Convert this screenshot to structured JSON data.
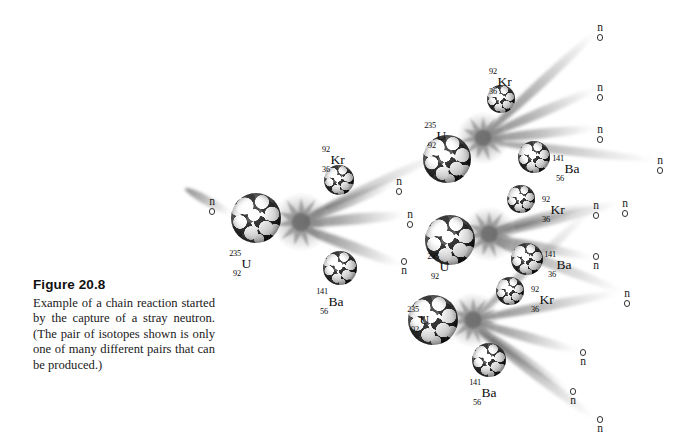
{
  "figure": {
    "number": "Figure 20.8",
    "caption": "Example of a chain reaction started by the capture of a stray neutron. (The pair of isotopes shown is only one of many different pairs that can be produced.)"
  },
  "chart_data": {
    "type": "diagram",
    "title": "Figure 20.8",
    "subtitle": "Nuclear fission chain reaction of uranium-235",
    "generations": 3,
    "neutrons_per_fission": 3,
    "target_nuclide": "235-92 U",
    "fission_products": [
      "92-36 Kr",
      "141-56 Ba"
    ],
    "nuclides": [
      {
        "id": "u-1",
        "symbol": "U",
        "mass": "235",
        "atomic": "92",
        "x": 256,
        "y": 218,
        "r": 25,
        "label_x": 226,
        "label_y": 250
      },
      {
        "id": "kr-1",
        "symbol": "Kr",
        "mass": "92",
        "atomic": "36",
        "x": 339,
        "y": 180,
        "r": 15,
        "label_x": 315,
        "label_y": 146
      },
      {
        "id": "ba-1",
        "symbol": "Ba",
        "mass": "141",
        "atomic": "56",
        "x": 340,
        "y": 268,
        "r": 17,
        "label_x": 313,
        "label_y": 288
      },
      {
        "id": "u-2",
        "symbol": "U",
        "mass": "235",
        "atomic": "92",
        "x": 447,
        "y": 159,
        "r": 24,
        "label_x": 421,
        "label_y": 122
      },
      {
        "id": "kr-2",
        "symbol": "Kr",
        "mass": "92",
        "atomic": "36",
        "x": 501,
        "y": 99,
        "r": 14,
        "label_x": 482,
        "label_y": 68
      },
      {
        "id": "ba-2",
        "symbol": "Ba",
        "mass": "141",
        "atomic": "56",
        "x": 534,
        "y": 157,
        "r": 16,
        "label_x": 549,
        "label_y": 155
      },
      {
        "id": "u-3",
        "symbol": "U",
        "mass": "235",
        "atomic": "92",
        "x": 450,
        "y": 240,
        "r": 25,
        "label_x": 424,
        "label_y": 253
      },
      {
        "id": "kr-3",
        "symbol": "Kr",
        "mass": "92",
        "atomic": "36",
        "x": 521,
        "y": 199,
        "r": 14,
        "label_x": 535,
        "label_y": 196
      },
      {
        "id": "ba-3",
        "symbol": "Ba",
        "mass": "141",
        "36": "36",
        "atomic": "36",
        "x": 527,
        "y": 259,
        "r": 16,
        "label_x": 541,
        "label_y": 251
      },
      {
        "id": "u-4",
        "symbol": "U",
        "mass": "235",
        "atomic": "92",
        "x": 433,
        "y": 320,
        "r": 25,
        "label_x": 404,
        "label_y": 306
      },
      {
        "id": "kr-4",
        "symbol": "Kr",
        "mass": "92",
        "atomic": "36",
        "x": 510,
        "y": 291,
        "r": 14,
        "label_x": 524,
        "label_y": 286
      },
      {
        "id": "ba-4",
        "symbol": "Ba",
        "mass": "141",
        "atomic": "56",
        "x": 489,
        "y": 360,
        "r": 17,
        "label_x": 466,
        "label_y": 379
      }
    ],
    "neutrons": [
      {
        "id": "n-stray",
        "label": "n",
        "x": 212,
        "y": 196,
        "dot_position": "below"
      },
      {
        "id": "n-g2-a",
        "label": "n",
        "x": 399,
        "y": 176,
        "dot_position": "below"
      },
      {
        "id": "n-g2-b",
        "label": "n",
        "x": 410,
        "y": 209,
        "dot_position": "below"
      },
      {
        "id": "n-g2-c",
        "label": "n",
        "x": 404,
        "y": 258,
        "dot_position": "above"
      },
      {
        "id": "n-g3-a",
        "label": "n",
        "x": 600,
        "y": 22,
        "dot_position": "below"
      },
      {
        "id": "n-g3-b",
        "label": "n",
        "x": 600,
        "y": 82,
        "dot_position": "below"
      },
      {
        "id": "n-g3-c",
        "label": "n",
        "x": 600,
        "y": 124,
        "dot_position": "below"
      },
      {
        "id": "n-g3-d",
        "label": "n",
        "x": 660,
        "y": 155,
        "dot_position": "below"
      },
      {
        "id": "n-g3-e",
        "label": "n",
        "x": 596,
        "y": 200,
        "dot_position": "below"
      },
      {
        "id": "n-g3-f",
        "label": "n",
        "x": 596,
        "y": 253,
        "dot_position": "above"
      },
      {
        "id": "n-g3-g",
        "label": "n",
        "x": 625,
        "y": 198,
        "dot_position": "below"
      },
      {
        "id": "n-g3-h",
        "label": "n",
        "x": 627,
        "y": 288,
        "dot_position": "below"
      },
      {
        "id": "n-g3-i",
        "label": "n",
        "x": 583,
        "y": 349,
        "dot_position": "above"
      },
      {
        "id": "n-g3-j",
        "label": "n",
        "x": 573,
        "y": 388,
        "dot_position": "above"
      },
      {
        "id": "n-g3-k",
        "label": "n",
        "x": 600,
        "y": 416,
        "dot_position": "above"
      }
    ],
    "fission_sites": [
      {
        "id": "flash-1",
        "x": 301,
        "y": 222,
        "size": 58
      },
      {
        "id": "flash-2",
        "x": 483,
        "y": 138,
        "size": 52
      },
      {
        "id": "flash-3",
        "x": 489,
        "y": 234,
        "size": 54
      },
      {
        "id": "flash-4",
        "x": 473,
        "y": 320,
        "size": 54
      }
    ],
    "colors": {
      "background": "#ffffff",
      "nucleon_dark": "#111111",
      "nucleon_light": "#ffffff",
      "ray": "#6e6e6e",
      "flash": "#8c8c8c",
      "text": "#111111"
    }
  }
}
